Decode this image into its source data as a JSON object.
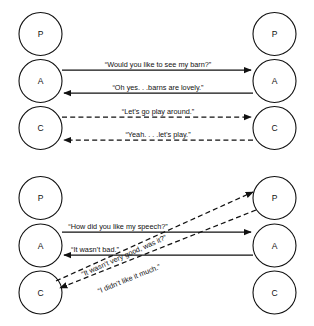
{
  "figure": {
    "background_color": "#ffffff",
    "ink_color": "#111111",
    "diagrams": [
      {
        "id": "complementary-transaction",
        "name": "complementary-transaction-diagram",
        "left_person": {
          "ego_states": [
            {
              "key": "parent",
              "label": "P"
            },
            {
              "key": "adult",
              "label": "A"
            },
            {
              "key": "child",
              "label": "C"
            }
          ]
        },
        "right_person": {
          "ego_states": [
            {
              "key": "parent",
              "label": "P"
            },
            {
              "key": "adult",
              "label": "A"
            },
            {
              "key": "child",
              "label": "C"
            }
          ]
        },
        "messages": [
          {
            "id": "msg-barn-question",
            "text": "“Would you like to see my barn?”",
            "from": "left-adult",
            "to": "right-adult",
            "direction": "left-to-right",
            "style": "solid"
          },
          {
            "id": "msg-barn-answer",
            "text": "“Oh yes. . .barns are lovely.”",
            "from": "right-adult",
            "to": "left-adult",
            "direction": "right-to-left",
            "style": "solid"
          },
          {
            "id": "msg-play-invite",
            "text": "“Let’s go play around.”",
            "from": "left-child",
            "to": "right-child",
            "direction": "left-to-right",
            "style": "dashed"
          },
          {
            "id": "msg-play-accept",
            "text": "“Yeah. . . .let’s play.”",
            "from": "right-child",
            "to": "left-child",
            "direction": "right-to-left",
            "style": "dashed"
          }
        ]
      },
      {
        "id": "ulterior-transaction",
        "name": "ulterior-transaction-diagram",
        "left_person": {
          "ego_states": [
            {
              "key": "parent",
              "label": "P"
            },
            {
              "key": "adult",
              "label": "A"
            },
            {
              "key": "child",
              "label": "C"
            }
          ]
        },
        "right_person": {
          "ego_states": [
            {
              "key": "parent",
              "label": "P"
            },
            {
              "key": "adult",
              "label": "A"
            },
            {
              "key": "child",
              "label": "C"
            }
          ]
        },
        "messages": [
          {
            "id": "msg-speech-question",
            "text": "“How did you like my speech?”",
            "from": "left-adult",
            "to": "right-adult",
            "direction": "left-to-right",
            "style": "solid"
          },
          {
            "id": "msg-speech-answer",
            "text": "“It wasn’t bad.”",
            "from": "right-adult",
            "to": "left-adult",
            "direction": "right-to-left",
            "style": "solid"
          },
          {
            "id": "msg-hidden-question",
            "text": "“It wasn’t very good, was it?”",
            "from": "left-child",
            "to": "right-parent",
            "direction": "left-to-right",
            "style": "dashed"
          },
          {
            "id": "msg-hidden-answer",
            "text": "“I didn’t like it much.”",
            "from": "right-parent",
            "to": "left-child",
            "direction": "right-to-left",
            "style": "dashed"
          }
        ]
      }
    ]
  }
}
